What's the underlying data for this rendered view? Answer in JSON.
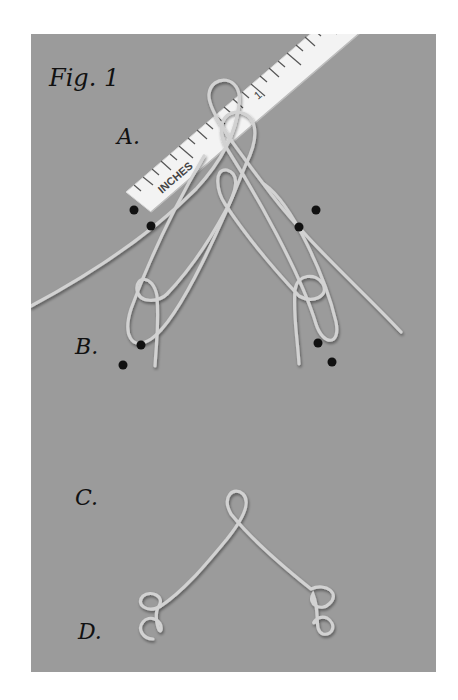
{
  "figure": {
    "title": "Fig. 1",
    "background_color": "#9b9b9b",
    "wire_color": "#cfcfcf",
    "marker_color": "#111111"
  },
  "ruler": {
    "unit_label": "INCHES",
    "number_label": "1"
  },
  "steps": [
    {
      "id": "A",
      "label": "A."
    },
    {
      "id": "B",
      "label": "B."
    },
    {
      "id": "C",
      "label": "C."
    },
    {
      "id": "D",
      "label": "D."
    }
  ]
}
